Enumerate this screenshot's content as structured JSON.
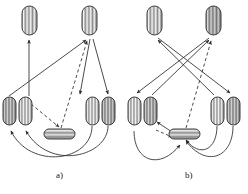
{
  "figure": {
    "title": "",
    "background_color": "#ffffff",
    "stroke_color": "#2b2b2b",
    "node_fill_light": "#f2f2f2",
    "node_fill_dark": "#bdbdbd",
    "node_stripe_color": "#6e6e6e",
    "width": 248,
    "height": 194
  },
  "panels": [
    {
      "id": "a",
      "caption": "a)",
      "caption_pos": {
        "x": 56,
        "y": 170
      },
      "nodes": [
        {
          "name": "top-left-capsule",
          "shape": "rounded-capsule-vertical",
          "x": 22,
          "y": 6,
          "w": 15,
          "h": 29
        },
        {
          "name": "top-right-capsule",
          "shape": "rounded-capsule-vertical",
          "x": 82,
          "y": 6,
          "w": 15,
          "h": 29
        },
        {
          "name": "mid-left-outer-capsule",
          "shape": "rounded-capsule-vertical",
          "x": 3,
          "y": 97,
          "w": 13,
          "h": 28
        },
        {
          "name": "mid-left-inner-capsule",
          "shape": "rounded-capsule-vertical",
          "x": 19,
          "y": 97,
          "w": 13,
          "h": 28
        },
        {
          "name": "mid-right-inner-capsule",
          "shape": "rounded-capsule-vertical",
          "x": 86,
          "y": 97,
          "w": 13,
          "h": 28
        },
        {
          "name": "mid-right-outer-capsule",
          "shape": "rounded-capsule-vertical",
          "x": 102,
          "y": 97,
          "w": 13,
          "h": 28
        },
        {
          "name": "bottom-center-capsule",
          "shape": "rounded-capsule-horizontal",
          "x": 44,
          "y": 129,
          "w": 31,
          "h": 10
        }
      ],
      "edges": [
        {
          "name": "edge-midleft-to-topleft",
          "style": "solid",
          "arrow": true
        },
        {
          "name": "edge-midleft-to-topright",
          "style": "solid",
          "arrow": true
        },
        {
          "name": "edge-topright-to-midrightinner",
          "style": "solid",
          "arrow": true
        },
        {
          "name": "edge-topright-to-midrightouter",
          "style": "solid",
          "arrow": true
        },
        {
          "name": "edge-midleftinner-to-center-dash",
          "style": "dashed",
          "arrow": true
        },
        {
          "name": "edge-center-to-topright-dash",
          "style": "dashed",
          "arrow": true
        },
        {
          "name": "edge-arc-rightinner-to-leftouter",
          "style": "solid",
          "arrow": true
        },
        {
          "name": "edge-arc-rightouter-to-leftinner",
          "style": "solid",
          "arrow": true
        }
      ]
    },
    {
      "id": "b",
      "caption": "b)",
      "caption_pos": {
        "x": 185,
        "y": 170
      },
      "nodes": [
        {
          "name": "top-left-capsule",
          "shape": "rounded-capsule-vertical",
          "x": 147,
          "y": 6,
          "w": 15,
          "h": 29
        },
        {
          "name": "top-right-capsule",
          "shape": "rounded-capsule-vertical",
          "x": 206,
          "y": 6,
          "w": 15,
          "h": 29
        },
        {
          "name": "mid-left-outer-capsule",
          "shape": "rounded-capsule-vertical",
          "x": 128,
          "y": 97,
          "w": 13,
          "h": 28
        },
        {
          "name": "mid-left-inner-capsule",
          "shape": "rounded-capsule-vertical",
          "x": 144,
          "y": 97,
          "w": 13,
          "h": 28
        },
        {
          "name": "mid-right-inner-capsule",
          "shape": "rounded-capsule-vertical",
          "x": 211,
          "y": 97,
          "w": 13,
          "h": 28
        },
        {
          "name": "mid-right-outer-capsule",
          "shape": "rounded-capsule-vertical",
          "x": 227,
          "y": 97,
          "w": 13,
          "h": 28
        },
        {
          "name": "bottom-center-capsule",
          "shape": "rounded-capsule-horizontal",
          "x": 169,
          "y": 129,
          "w": 31,
          "h": 10
        }
      ],
      "edges": [
        {
          "name": "edge-midleftinner-to-topright",
          "style": "solid",
          "arrow": true
        },
        {
          "name": "edge-midrightinner-to-topleft",
          "style": "solid",
          "arrow": true
        },
        {
          "name": "edge-topright-to-midleftouter",
          "style": "solid",
          "arrow": true
        },
        {
          "name": "edge-topleft-to-midrightouter",
          "style": "solid",
          "arrow": true
        },
        {
          "name": "edge-center-to-topright-dash",
          "style": "dashed",
          "arrow": true
        },
        {
          "name": "edge-center-to-midleftinner",
          "style": "solid",
          "arrow": true
        },
        {
          "name": "edge-center-to-midleftinner-dash",
          "style": "dashed",
          "arrow": true
        },
        {
          "name": "edge-arc-rightinner-to-center",
          "style": "solid",
          "arrow": true
        },
        {
          "name": "edge-arc-rightouter-to-center",
          "style": "solid",
          "arrow": true
        },
        {
          "name": "edge-arc-leftouter-to-center",
          "style": "solid",
          "arrow": true
        }
      ]
    }
  ]
}
